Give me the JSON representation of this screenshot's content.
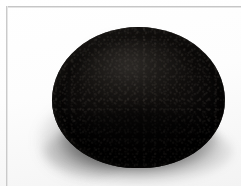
{
  "image": {
    "kind": "photograph",
    "subject_name": "dark-round-object",
    "subject_description": "Dark near-black rounded domed object photographed on a plain white background",
    "caption": "",
    "background_color": "#fefefe",
    "frame_line_color": "#c6c6c6",
    "object_color_core": "#030202",
    "object_color_highlight": "#1c1a18",
    "shadow_color": "#141414",
    "lighting": "soft diffuse light from upper left",
    "shadow_direction": "lower left and beneath"
  },
  "frame": {
    "top_rule_label": "frame-top-rule",
    "left_rule_label": "frame-left-rule"
  },
  "overlays": {
    "text_present": "none",
    "annotations": []
  }
}
